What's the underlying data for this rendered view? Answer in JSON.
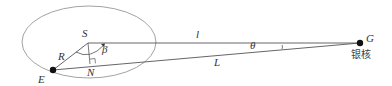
{
  "diagram": {
    "type": "geometry",
    "points": {
      "S": {
        "label": "S",
        "x": 88,
        "y": 43
      },
      "E": {
        "label": "E",
        "x": 53,
        "y": 70
      },
      "N": {
        "label": "N",
        "x": 90,
        "y": 64
      },
      "G": {
        "label": "G",
        "x": 360,
        "y": 43,
        "caption": "银核"
      }
    },
    "segments": {
      "R": {
        "label": "R"
      },
      "l": {
        "label": "l"
      },
      "L": {
        "label": "L"
      }
    },
    "angles": {
      "beta": {
        "label": "β"
      },
      "theta": {
        "label": "θ"
      }
    },
    "colors": {
      "line": "#555555",
      "ellipse": "#888888",
      "dot": "#111111"
    }
  }
}
